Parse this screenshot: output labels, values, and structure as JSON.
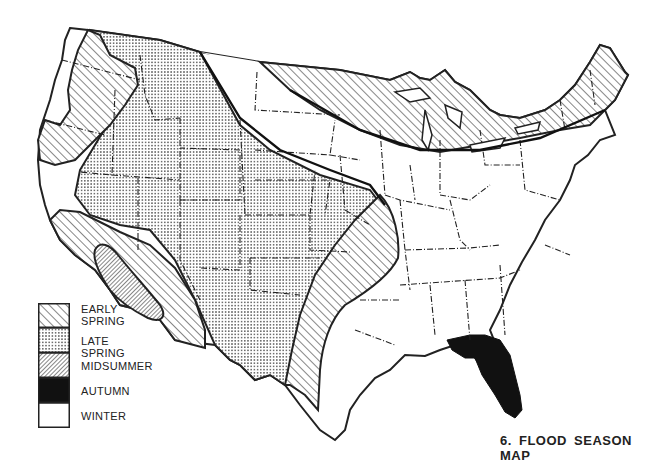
{
  "title": "6. FLOOD SEASON MAP",
  "legend": {
    "items": [
      {
        "label_line1": "EARLY",
        "label_line2": "SPRING",
        "pattern": "diagonal-hatch-wide",
        "season": "early spring"
      },
      {
        "label_line1": "LATE SPRING",
        "label_line2": "",
        "pattern": "dot-stipple",
        "season": "late spring"
      },
      {
        "label_line1": "MIDSUMMER",
        "label_line2": "",
        "pattern": "diagonal-hatch-dense",
        "season": "midsummer"
      },
      {
        "label_line1": "AUTUMN",
        "label_line2": "",
        "pattern": "solid-black",
        "season": "autumn"
      },
      {
        "label_line1": "WINTER",
        "label_line2": "",
        "pattern": "blank-white",
        "season": "winter"
      }
    ]
  },
  "regions": [
    {
      "name": "Pacific Northwest coast",
      "season": "early spring"
    },
    {
      "name": "Interior West / Rockies / Great Plains",
      "season": "late spring"
    },
    {
      "name": "Southern California / Arizona band",
      "season": "early spring"
    },
    {
      "name": "Southern California desert core",
      "season": "midsummer"
    },
    {
      "name": "Northern tier / Great Lakes / New England",
      "season": "early spring"
    },
    {
      "name": "Lower Mississippi valley / East Texas",
      "season": "early spring"
    },
    {
      "name": "Florida peninsula",
      "season": "autumn"
    },
    {
      "name": "Northern Plains gap / Midwest / East / South",
      "season": "winter"
    }
  ],
  "colors": {
    "ink": "#222222",
    "paper": "#ffffff"
  }
}
